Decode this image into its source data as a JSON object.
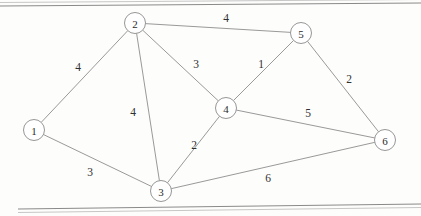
{
  "figure": {
    "type": "weighted-undirected-graph",
    "background_color": "#fdfdfc",
    "node_stroke_color": "#8a8a8a",
    "edge_stroke_color": "#8d8d8d",
    "label_color": "#303030",
    "node_radius": 10.5
  },
  "nodes": [
    {
      "id": "1",
      "label": "1",
      "x": 34,
      "y": 130
    },
    {
      "id": "2",
      "label": "2",
      "x": 135,
      "y": 23
    },
    {
      "id": "3",
      "label": "3",
      "x": 161,
      "y": 191
    },
    {
      "id": "4",
      "label": "4",
      "x": 226,
      "y": 108
    },
    {
      "id": "5",
      "label": "5",
      "x": 301,
      "y": 33
    },
    {
      "id": "6",
      "label": "6",
      "x": 385,
      "y": 140
    }
  ],
  "edges": [
    {
      "from": "1",
      "to": "2",
      "weight": "4",
      "label_x": 78,
      "label_y": 67
    },
    {
      "from": "1",
      "to": "3",
      "weight": "3",
      "label_x": 90,
      "label_y": 172
    },
    {
      "from": "2",
      "to": "3",
      "weight": "4",
      "label_x": 133,
      "label_y": 112
    },
    {
      "from": "2",
      "to": "4",
      "weight": "3",
      "label_x": 196,
      "label_y": 64
    },
    {
      "from": "2",
      "to": "5",
      "weight": "4",
      "label_x": 226,
      "label_y": 18
    },
    {
      "from": "3",
      "to": "4",
      "weight": "2",
      "label_x": 194,
      "label_y": 145
    },
    {
      "from": "3",
      "to": "6",
      "weight": "6",
      "label_x": 268,
      "label_y": 178
    },
    {
      "from": "4",
      "to": "5",
      "weight": "1",
      "label_x": 261,
      "label_y": 64
    },
    {
      "from": "4",
      "to": "6",
      "weight": "5",
      "label_x": 308,
      "label_y": 113
    },
    {
      "from": "5",
      "to": "6",
      "weight": "2",
      "label_x": 349,
      "label_y": 79
    }
  ],
  "rules": [
    {
      "name": "top-rule",
      "x1": 0,
      "y1": 6,
      "x2": 421,
      "y2": 3
    },
    {
      "name": "bottom-rule",
      "x1": 18,
      "y1": 209,
      "x2": 421,
      "y2": 204
    }
  ]
}
